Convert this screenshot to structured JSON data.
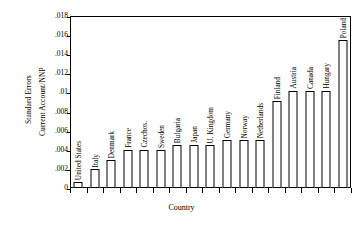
{
  "chart_data": {
    "type": "bar",
    "title": "",
    "xlabel": "Country",
    "ylabel_lines": [
      "Standard Errors",
      "Current Account/NNP"
    ],
    "ylim": [
      0,
      0.018
    ],
    "ytick_labels": [
      "0",
      ".002",
      ".004",
      ".006",
      ".008",
      ".01",
      ".012",
      ".014",
      ".016",
      ".018"
    ],
    "ytick_values": [
      0,
      0.002,
      0.004,
      0.006,
      0.008,
      0.01,
      0.012,
      0.014,
      0.016,
      0.018
    ],
    "grid": false,
    "legend": "none",
    "categories": [
      "United States",
      "Italy",
      "Denmark",
      "France",
      "Czechos.",
      "Sweden",
      "Bulgaria",
      "Japan",
      "U. Kingdom",
      "Germany",
      "Norway",
      "Netherlands",
      "Finland",
      "Austria",
      "Canada",
      "Hungary",
      "Poland"
    ],
    "values": [
      0.0006,
      0.002,
      0.0029,
      0.004,
      0.004,
      0.004,
      0.0045,
      0.0045,
      0.0045,
      0.005,
      0.005,
      0.005,
      0.0091,
      0.0102,
      0.0102,
      0.0102,
      0.0155
    ]
  },
  "axes": {
    "x_title": "Country",
    "y_title_outer": "Standard Errors",
    "y_title_inner": "Current Account/NNP"
  },
  "style": {
    "bar_fill": "#ffffff",
    "bar_stroke": "#000000",
    "frame_color": "#000000",
    "background": "#ffffff"
  }
}
